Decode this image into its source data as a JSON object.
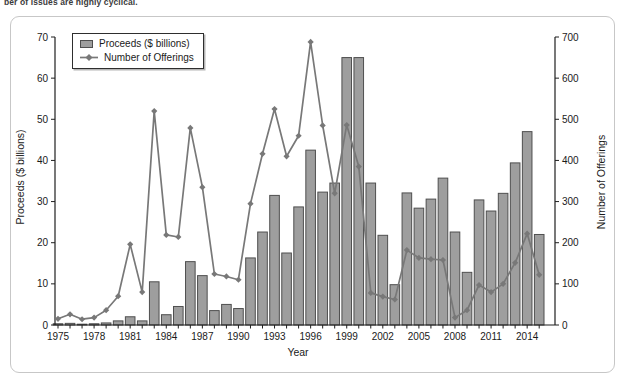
{
  "caption_fragment": "ber of issues are highly cyclical.",
  "chart_data": {
    "type": "bar+line",
    "title": "",
    "xlabel": "Year",
    "grid": false,
    "years": [
      1975,
      1976,
      1977,
      1978,
      1979,
      1980,
      1981,
      1982,
      1983,
      1984,
      1985,
      1986,
      1987,
      1988,
      1989,
      1990,
      1991,
      1992,
      1993,
      1994,
      1995,
      1996,
      1997,
      1998,
      1999,
      2000,
      2001,
      2002,
      2003,
      2004,
      2005,
      2006,
      2007,
      2008,
      2009,
      2010,
      2011,
      2012,
      2013,
      2014,
      2015
    ],
    "x_tick_labels": [
      1975,
      1978,
      1981,
      1984,
      1987,
      1990,
      1993,
      1996,
      1999,
      2002,
      2005,
      2008,
      2011,
      2014
    ],
    "axes": {
      "left": {
        "label": "Proceeds ($ billions)",
        "min": 0,
        "max": 70,
        "ticks": [
          0,
          10,
          20,
          30,
          40,
          50,
          60,
          70
        ]
      },
      "right": {
        "label": "Number of Offerings",
        "min": 0,
        "max": 700,
        "ticks": [
          0,
          100,
          200,
          300,
          400,
          500,
          600,
          700
        ]
      }
    },
    "legend": {
      "position": "top-left-inside"
    },
    "series": [
      {
        "name": "Proceeds ($ billions)",
        "type": "bar",
        "axis": "left",
        "color": "#9e9e9e",
        "border_color": "#4f4f4f",
        "values": [
          0.3,
          0.4,
          0.2,
          0.3,
          0.5,
          1.0,
          2.0,
          1.0,
          10.5,
          2.5,
          4.5,
          15.4,
          12.0,
          3.5,
          5.0,
          4.0,
          16.3,
          22.6,
          31.5,
          17.5,
          28.7,
          42.5,
          32.3,
          34.5,
          65.0,
          65.0,
          34.5,
          21.8,
          9.8,
          32.1,
          28.4,
          30.6,
          35.7,
          22.6,
          12.8,
          30.4,
          27.7,
          32.0,
          39.4,
          47.0,
          22.0
        ]
      },
      {
        "name": "Number of Offerings",
        "type": "line",
        "axis": "right",
        "color": "#787878",
        "marker": "diamond",
        "values": [
          15,
          26,
          14,
          18,
          36,
          70,
          196,
          80,
          520,
          219,
          214,
          479,
          335,
          124,
          118,
          110,
          295,
          416,
          525,
          410,
          460,
          688,
          485,
          320,
          486,
          385,
          78,
          69,
          62,
          182,
          163,
          160,
          158,
          18,
          36,
          97,
          80,
          100,
          151,
          222,
          122
        ]
      }
    ]
  }
}
